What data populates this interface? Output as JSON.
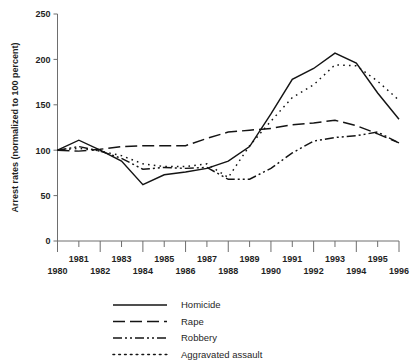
{
  "chart_data": {
    "type": "line",
    "title": "",
    "subtitle": "",
    "xlabel": "",
    "ylabel": "Arrest rates (normalized to 100 percent)",
    "xlim": [
      1980,
      1996
    ],
    "ylim": [
      0,
      250
    ],
    "grid": false,
    "legend_position": "bottom-center",
    "y_ticks": [
      0,
      50,
      100,
      150,
      200,
      250
    ],
    "y_tick_labels": [
      "0",
      "50",
      "100",
      "150",
      "200",
      "250"
    ],
    "x_ticks": [
      1980,
      1981,
      1982,
      1983,
      1984,
      1985,
      1986,
      1987,
      1988,
      1989,
      1990,
      1991,
      1992,
      1993,
      1994,
      1995,
      1996
    ],
    "x_tick_labels_lower": [
      "1980",
      "1982",
      "1984",
      "1986",
      "1988",
      "1990",
      "1992",
      "1994",
      "1996"
    ],
    "x_tick_labels_upper": [
      "1981",
      "1983",
      "1985",
      "1987",
      "1989",
      "1991",
      "1993",
      "1995"
    ],
    "x": [
      1980,
      1981,
      1982,
      1983,
      1984,
      1985,
      1986,
      1987,
      1988,
      1989,
      1990,
      1991,
      1992,
      1993,
      1994,
      1995,
      1996
    ],
    "series": [
      {
        "name": "Homicide",
        "style": "solid",
        "dash": "none",
        "color": "#141414",
        "values": [
          100,
          111,
          100,
          88,
          62,
          73,
          76,
          80,
          88,
          104,
          140,
          178,
          190,
          207,
          196,
          163,
          134
        ]
      },
      {
        "name": "Rape",
        "style": "dashed",
        "dash": "12,5",
        "color": "#141414",
        "values": [
          100,
          99,
          101,
          104,
          105,
          105,
          105,
          113,
          120,
          122,
          124,
          128,
          130,
          133,
          127,
          118,
          108
        ]
      },
      {
        "name": "Robbery",
        "style": "dash-dot",
        "dash": "9,3,2,3,2,3",
        "color": "#141414",
        "values": [
          100,
          104,
          99,
          91,
          79,
          81,
          80,
          81,
          68,
          68,
          80,
          97,
          110,
          114,
          116,
          120,
          108
        ]
      },
      {
        "name": "Aggravated assault",
        "style": "dotted",
        "dash": "1.6,4.2",
        "color": "#141414",
        "values": [
          100,
          102,
          99,
          94,
          85,
          82,
          82,
          85,
          70,
          105,
          132,
          158,
          172,
          194,
          193,
          176,
          155
        ]
      }
    ]
  },
  "legend": {
    "entries": [
      {
        "label": "Homicide"
      },
      {
        "label": "Rape"
      },
      {
        "label": "Robbery"
      },
      {
        "label": "Aggravated assault"
      }
    ]
  }
}
